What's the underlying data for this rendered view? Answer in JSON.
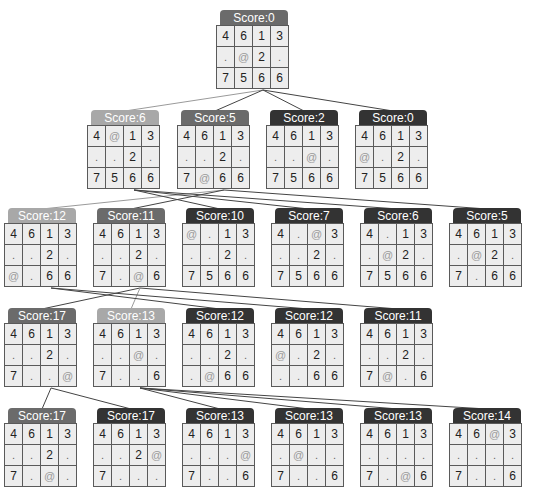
{
  "header": {
    "title_fragment": ""
  },
  "colors": {
    "badge_dark": "#333333",
    "badge_mid": "#6b6b6b",
    "badge_light": "#a8a8a8",
    "cell_bg": "#ededed",
    "grid_line": "#5a5a5a",
    "edge": "#444444"
  },
  "legend": {
    "agent_symbol": "@",
    "empty_symbol": "."
  },
  "nodes": [
    {
      "id": "n0",
      "label": "Score:0",
      "shade": "mid",
      "x": 216,
      "y": 10,
      "parent": null,
      "grid": [
        [
          "4",
          "6",
          "1",
          "3"
        ],
        [
          ".",
          "@",
          "2",
          "."
        ],
        [
          "7",
          "5",
          "6",
          "6"
        ]
      ]
    },
    {
      "id": "n1",
      "label": "Score:6",
      "shade": "light",
      "x": 87,
      "y": 110,
      "parent": "n0",
      "grid": [
        [
          "4",
          "@",
          "1",
          "3"
        ],
        [
          ".",
          ".",
          "2",
          "."
        ],
        [
          "7",
          "5",
          "6",
          "6"
        ]
      ]
    },
    {
      "id": "n2",
      "label": "Score:5",
      "shade": "mid",
      "x": 177,
      "y": 110,
      "parent": "n0",
      "grid": [
        [
          "4",
          "6",
          "1",
          "3"
        ],
        [
          ".",
          ".",
          "2",
          "."
        ],
        [
          "7",
          "@",
          "6",
          "6"
        ]
      ]
    },
    {
      "id": "n3",
      "label": "Score:2",
      "shade": "dark",
      "x": 266,
      "y": 110,
      "parent": "n0",
      "grid": [
        [
          "4",
          "6",
          "1",
          "3"
        ],
        [
          ".",
          ".",
          "@",
          "."
        ],
        [
          "7",
          "5",
          "6",
          "6"
        ]
      ]
    },
    {
      "id": "n4",
      "label": "Score:0",
      "shade": "dark",
      "x": 355,
      "y": 110,
      "parent": "n0",
      "grid": [
        [
          "4",
          "6",
          "1",
          "3"
        ],
        [
          "@",
          ".",
          "2",
          "."
        ],
        [
          "7",
          "5",
          "6",
          "6"
        ]
      ]
    },
    {
      "id": "n5",
      "label": "Score:12",
      "shade": "light",
      "x": 4,
      "y": 208,
      "parent": "n2",
      "grid": [
        [
          "4",
          "6",
          "1",
          "3"
        ],
        [
          ".",
          ".",
          "2",
          "."
        ],
        [
          "@",
          ".",
          "6",
          "6"
        ]
      ]
    },
    {
      "id": "n6",
      "label": "Score:11",
      "shade": "mid",
      "x": 93,
      "y": 208,
      "parent": "n2",
      "grid": [
        [
          "4",
          "6",
          "1",
          "3"
        ],
        [
          ".",
          ".",
          "2",
          "."
        ],
        [
          "7",
          ".",
          "@",
          "6"
        ]
      ]
    },
    {
      "id": "n7",
      "label": "Score:10",
      "shade": "dark",
      "x": 182,
      "y": 208,
      "parent": "n1",
      "grid": [
        [
          "@",
          ".",
          "1",
          "3"
        ],
        [
          ".",
          ".",
          "2",
          "."
        ],
        [
          "7",
          "5",
          "6",
          "6"
        ]
      ]
    },
    {
      "id": "n8",
      "label": "Score:7",
      "shade": "dark",
      "x": 271,
      "y": 208,
      "parent": "n1",
      "grid": [
        [
          "4",
          ".",
          "@",
          "3"
        ],
        [
          ".",
          ".",
          "2",
          "."
        ],
        [
          "7",
          "5",
          "6",
          "6"
        ]
      ]
    },
    {
      "id": "n9",
      "label": "Score:6",
      "shade": "dark",
      "x": 360,
      "y": 208,
      "parent": "n1",
      "grid": [
        [
          "4",
          ".",
          "1",
          "3"
        ],
        [
          ".",
          "@",
          "2",
          "."
        ],
        [
          "7",
          "5",
          "6",
          "6"
        ]
      ]
    },
    {
      "id": "n10",
      "label": "Score:5",
      "shade": "dark",
      "x": 449,
      "y": 208,
      "parent": "n2",
      "grid": [
        [
          "4",
          "6",
          "1",
          "3"
        ],
        [
          ".",
          "@",
          "2",
          "."
        ],
        [
          "7",
          ".",
          "6",
          "6"
        ]
      ]
    },
    {
      "id": "n11",
      "label": "Score:17",
      "shade": "mid",
      "x": 4,
      "y": 308,
      "parent": "n6",
      "grid": [
        [
          "4",
          "6",
          "1",
          "3"
        ],
        [
          ".",
          ".",
          "2",
          "."
        ],
        [
          "7",
          ".",
          ".",
          "@"
        ]
      ]
    },
    {
      "id": "n12",
      "label": "Score:13",
      "shade": "light",
      "x": 93,
      "y": 308,
      "parent": "n6",
      "grid": [
        [
          "4",
          "6",
          "1",
          "3"
        ],
        [
          ".",
          ".",
          "@",
          "."
        ],
        [
          "7",
          ".",
          ".",
          "6"
        ]
      ]
    },
    {
      "id": "n13",
      "label": "Score:12",
      "shade": "dark",
      "x": 182,
      "y": 308,
      "parent": "n5",
      "grid": [
        [
          "4",
          "6",
          "1",
          "3"
        ],
        [
          ".",
          ".",
          "2",
          "."
        ],
        [
          ".",
          "@",
          "6",
          "6"
        ]
      ]
    },
    {
      "id": "n14",
      "label": "Score:12",
      "shade": "dark",
      "x": 271,
      "y": 308,
      "parent": "n5",
      "grid": [
        [
          "4",
          "6",
          "1",
          "3"
        ],
        [
          "@",
          ".",
          "2",
          "."
        ],
        [
          ".",
          ".",
          "6",
          "6"
        ]
      ]
    },
    {
      "id": "n15",
      "label": "Score:11",
      "shade": "dark",
      "x": 360,
      "y": 308,
      "parent": "n6",
      "grid": [
        [
          "4",
          "6",
          "1",
          "3"
        ],
        [
          ".",
          ".",
          "2",
          "."
        ],
        [
          "7",
          "@",
          ".",
          "6"
        ]
      ]
    },
    {
      "id": "n16",
      "label": "Score:17",
      "shade": "mid",
      "x": 4,
      "y": 408,
      "parent": "n11",
      "grid": [
        [
          "4",
          "6",
          "1",
          "3"
        ],
        [
          ".",
          ".",
          "2",
          "."
        ],
        [
          "7",
          ".",
          "@",
          "."
        ]
      ]
    },
    {
      "id": "n17",
      "label": "Score:17",
      "shade": "dark",
      "x": 93,
      "y": 408,
      "parent": "n11",
      "grid": [
        [
          "4",
          "6",
          "1",
          "3"
        ],
        [
          ".",
          ".",
          "2",
          "@"
        ],
        [
          "7",
          ".",
          ".",
          "."
        ]
      ]
    },
    {
      "id": "n18",
      "label": "Score:13",
      "shade": "dark",
      "x": 182,
      "y": 408,
      "parent": "n12",
      "grid": [
        [
          "4",
          "6",
          "1",
          "3"
        ],
        [
          ".",
          ".",
          ".",
          "@"
        ],
        [
          "7",
          ".",
          ".",
          "6"
        ]
      ]
    },
    {
      "id": "n19",
      "label": "Score:13",
      "shade": "dark",
      "x": 271,
      "y": 408,
      "parent": "n12",
      "grid": [
        [
          "4",
          "6",
          "1",
          "3"
        ],
        [
          ".",
          "@",
          ".",
          "."
        ],
        [
          "7",
          ".",
          ".",
          "6"
        ]
      ]
    },
    {
      "id": "n20",
      "label": "Score:13",
      "shade": "dark",
      "x": 360,
      "y": 408,
      "parent": "n12",
      "grid": [
        [
          "4",
          "6",
          "1",
          "3"
        ],
        [
          ".",
          ".",
          ".",
          "."
        ],
        [
          "7",
          ".",
          "@",
          "6"
        ]
      ]
    },
    {
      "id": "n21",
      "label": "Score:14",
      "shade": "dark",
      "x": 449,
      "y": 408,
      "parent": "n12",
      "grid": [
        [
          "4",
          "6",
          "@",
          "3"
        ],
        [
          ".",
          ".",
          ".",
          "."
        ],
        [
          "7",
          ".",
          ".",
          "6"
        ]
      ]
    }
  ]
}
